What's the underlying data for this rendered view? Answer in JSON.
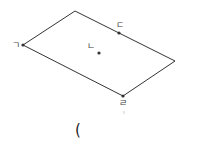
{
  "diagram": {
    "type": "parallelogram",
    "stroke_color": "#333333",
    "point_color": "#333333",
    "vertices": [
      {
        "name": "top",
        "x": 75,
        "y": 11
      },
      {
        "name": "right",
        "x": 175,
        "y": 61
      },
      {
        "name": "bottom",
        "x": 123,
        "y": 96
      },
      {
        "name": "left",
        "x": 23,
        "y": 45
      }
    ],
    "points": [
      {
        "id": "giyeok",
        "label": "ㄱ",
        "x": 23,
        "y": 45,
        "label_x": 12,
        "label_y": 48
      },
      {
        "id": "nieun",
        "label": "ㄴ",
        "x": 99,
        "y": 53,
        "label_x": 87,
        "label_y": 49
      },
      {
        "id": "digeut",
        "label": "ㄷ",
        "x": 119,
        "y": 33,
        "label_x": 116,
        "label_y": 28
      },
      {
        "id": "rieul",
        "label": "ㄹ",
        "x": 123,
        "y": 96,
        "label_x": 119,
        "label_y": 106
      }
    ]
  },
  "answer": {
    "open_paren": "("
  }
}
